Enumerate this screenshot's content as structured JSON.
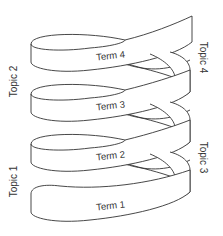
{
  "diagram": {
    "type": "helix-ribbon",
    "terms": [
      {
        "label": "Term 4"
      },
      {
        "label": "Term 3"
      },
      {
        "label": "Term 2"
      },
      {
        "label": "Term 1"
      }
    ],
    "topics": {
      "left": [
        {
          "label": "Topic 2"
        },
        {
          "label": "Topic 1"
        }
      ],
      "right": [
        {
          "label": "Topic 4"
        },
        {
          "label": "Topic 3"
        }
      ]
    },
    "colors": {
      "stroke": "#333333",
      "fill": "#ffffff"
    }
  }
}
